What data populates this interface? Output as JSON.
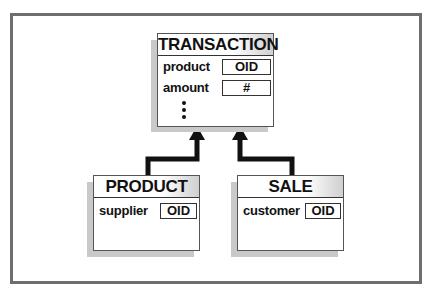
{
  "diagram": {
    "type": "class-inheritance",
    "parent": {
      "name": "TRANSACTION",
      "attributes": [
        {
          "name": "product",
          "type": "OID"
        },
        {
          "name": "amount",
          "type": "#"
        }
      ],
      "more_indicator": "⋮"
    },
    "children": [
      {
        "name": "PRODUCT",
        "attributes": [
          {
            "name": "supplier",
            "type": "OID"
          }
        ]
      },
      {
        "name": "SALE",
        "attributes": [
          {
            "name": "customer",
            "type": "OID"
          }
        ]
      }
    ],
    "edges": [
      {
        "from": "PRODUCT",
        "to": "TRANSACTION",
        "style": "thick-arrow"
      },
      {
        "from": "SALE",
        "to": "TRANSACTION",
        "style": "thick-arrow"
      }
    ],
    "colors": {
      "frame": "#6e6e6e",
      "shadow": "#c9c9c9",
      "line": "#111111"
    }
  }
}
